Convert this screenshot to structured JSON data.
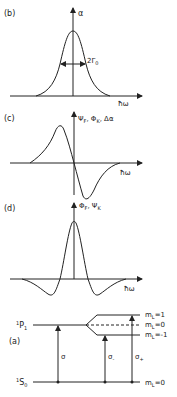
{
  "panels": {
    "b": {
      "label": "(b)",
      "y_axis": "α",
      "x_axis": "ħω",
      "annotation_main": "2Γ",
      "annotation_sub": "0",
      "curve": "absorption (Lorentzian peak)"
    },
    "c": {
      "label": "(c)",
      "y_axis": "Ψ",
      "y_axis_sub": "F",
      "y_axis_2": ", Φ",
      "y_axis_2_sub": "K",
      "y_axis_3": ", Δα",
      "x_axis": "ħω",
      "curve": "dispersive (odd) lineshape"
    },
    "d": {
      "label": "(d)",
      "y_axis": "Φ",
      "y_axis_sub": "F",
      "y_axis_2": ", Ψ",
      "y_axis_2_sub": "K",
      "x_axis": "ħω",
      "curve": "second-derivative-like lineshape"
    },
    "a": {
      "label": "(a)",
      "upper_level": "P",
      "upper_level_sup": "1",
      "upper_level_sub": "1",
      "lower_level": "S",
      "lower_level_sup": "1",
      "lower_level_sub": "0",
      "sublevels": [
        {
          "name": "m",
          "sub": "L",
          "value": "=1"
        },
        {
          "name": "m",
          "sub": "L",
          "value": "=0"
        },
        {
          "name": "m",
          "sub": "L",
          "value": "=-1"
        }
      ],
      "ground_sublevel": {
        "name": "m",
        "sub": "L",
        "value": "=0"
      },
      "transitions": [
        {
          "label": "σ",
          "sub": ""
        },
        {
          "label": "σ",
          "sub": "-"
        },
        {
          "label": "σ",
          "sub": "+"
        }
      ]
    }
  }
}
